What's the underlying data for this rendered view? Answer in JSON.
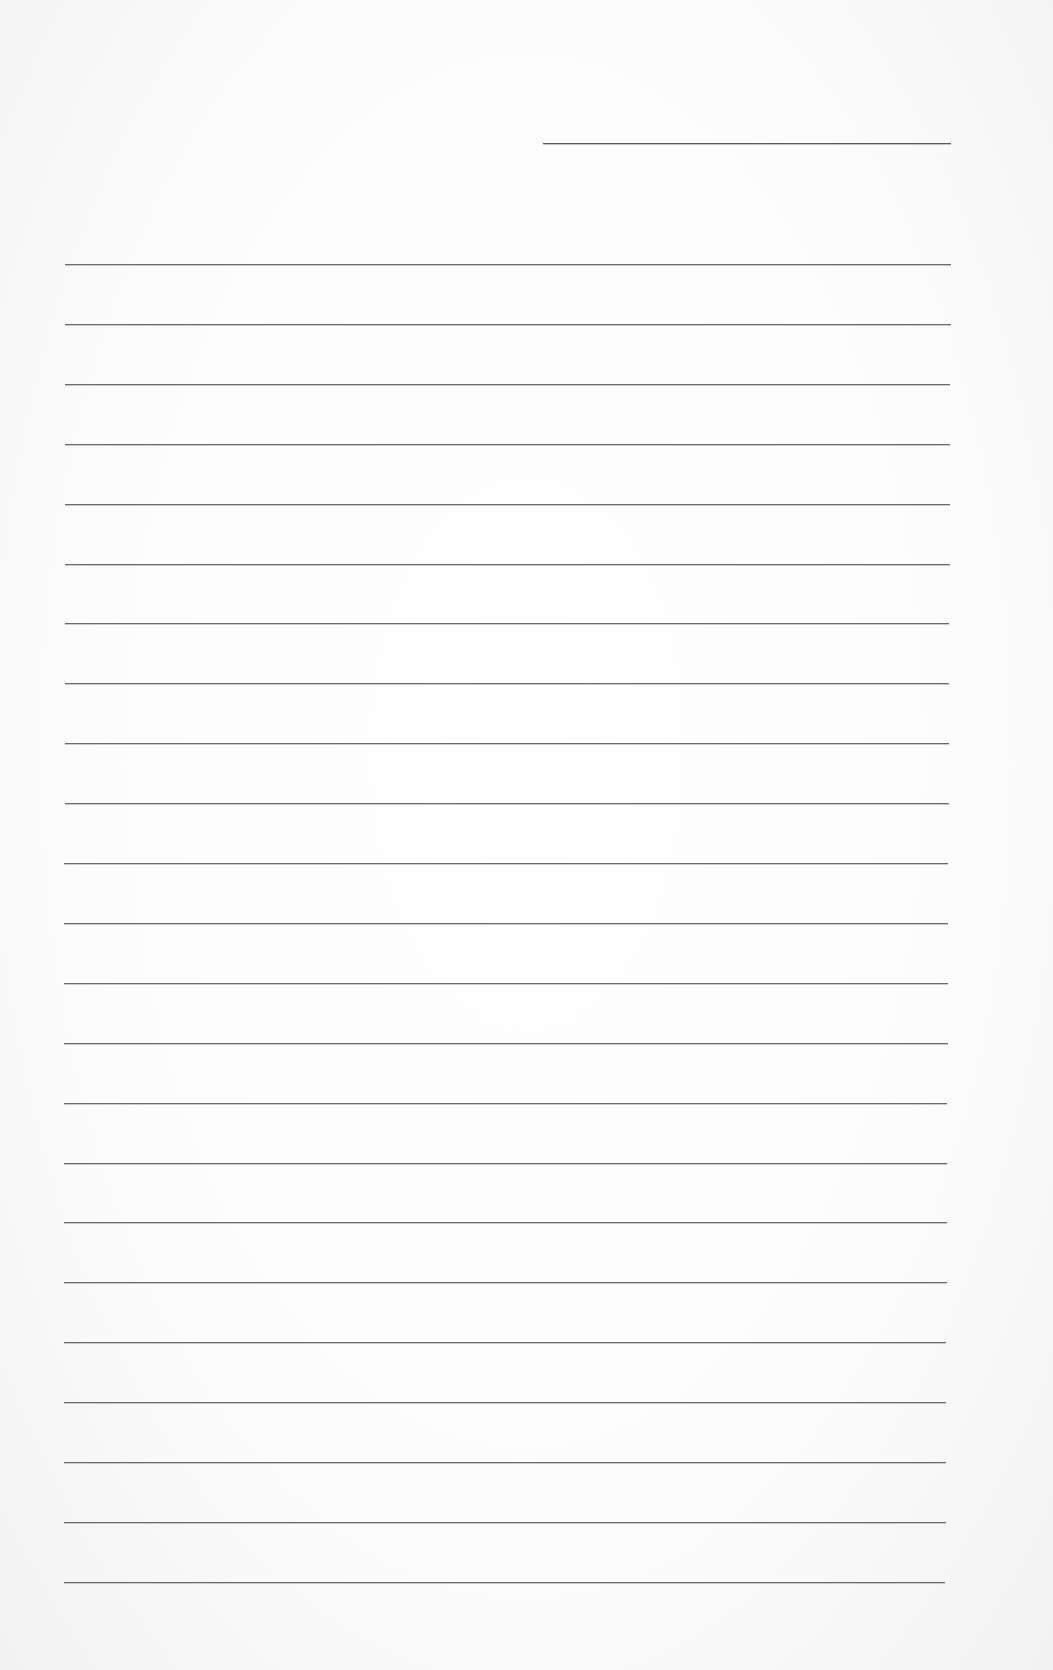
{
  "page": {
    "type": "ruled-paper",
    "background_color": "#ffffff",
    "line_color": "#6b6b6b",
    "text_content": []
  },
  "header_line": {
    "x": 543,
    "y": 143,
    "width": 408
  },
  "rules": {
    "count": 23,
    "first_y": 264,
    "spacing": 59.9,
    "left_x": 65,
    "right_x": 951
  }
}
